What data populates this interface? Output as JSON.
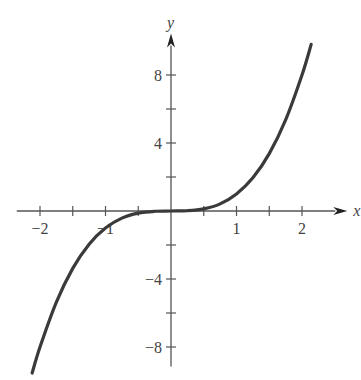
{
  "chart_data": {
    "type": "line",
    "title": "",
    "xlabel": "x",
    "ylabel": "y",
    "function": "y = x^3",
    "xlim": [
      -2.4,
      2.6
    ],
    "ylim": [
      -9.5,
      10.2
    ],
    "grid": false,
    "legend": "none",
    "x_ticks": [
      -2,
      -1.5,
      -1,
      -0.5,
      0.5,
      1,
      1.5,
      2
    ],
    "x_tick_labels": [
      {
        "value": -2,
        "label": "−2"
      },
      {
        "value": -1,
        "label": "−1"
      },
      {
        "value": 1,
        "label": "1"
      },
      {
        "value": 2,
        "label": "2"
      }
    ],
    "y_ticks": [
      -8,
      -6,
      -4,
      -2,
      2,
      4,
      6,
      8
    ],
    "y_tick_labels": [
      {
        "value": 8,
        "label": "8"
      },
      {
        "value": 4,
        "label": "4"
      },
      {
        "value": -4,
        "label": "−4"
      },
      {
        "value": -8,
        "label": "−8"
      }
    ],
    "series": [
      {
        "name": "x^3",
        "x": [
          -2.12,
          -2.0,
          -1.75,
          -1.5,
          -1.25,
          -1.0,
          -0.75,
          -0.5,
          -0.25,
          0,
          0.25,
          0.5,
          0.75,
          1.0,
          1.25,
          1.5,
          1.75,
          2.0,
          2.14
        ],
        "y": [
          -9.53,
          -8.0,
          -5.36,
          -3.375,
          -1.95,
          -1.0,
          -0.42,
          -0.125,
          -0.016,
          0,
          0.016,
          0.125,
          0.42,
          1.0,
          1.95,
          3.375,
          5.36,
          8.0,
          9.8
        ]
      }
    ],
    "colors": {
      "curve": "#3a3a3a",
      "axes": "#555555",
      "text": "#444444"
    }
  }
}
